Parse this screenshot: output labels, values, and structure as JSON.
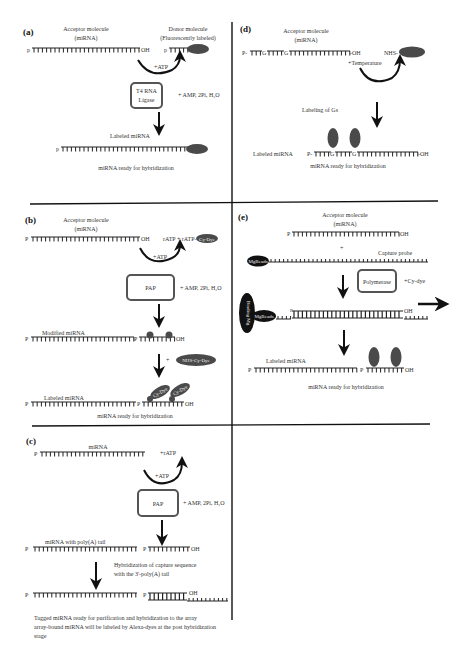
{
  "panels": {
    "a": {
      "label": "(a)",
      "acceptor": "Acceptor molecule",
      "acceptor_sub": "(miRNA)",
      "donor": "Donor molecule",
      "donor_sub": "(Fluorescently labeled)",
      "p": "p",
      "oh": "OH",
      "atp": "+ATP",
      "enzyme_line1": "T4 RNA",
      "enzyme_line2": "Ligase",
      "byproducts": "+ AMP, 2Pi, H₂O",
      "labeled": "Labeled miRNA",
      "ready": "miRNA ready for hybridization"
    },
    "b": {
      "label": "(b)",
      "acceptor": "Acceptor molecule",
      "acceptor_sub": "(miRNA)",
      "p": "P",
      "oh": "OH",
      "ratp": "rATP + rATP-",
      "dye": "Cy-Dye",
      "atp": "+ATP",
      "enzyme": "PAP",
      "byproducts": "+ AMP, 2Pi, H₂O",
      "modified": "Modified miRNA",
      "nhs": "NHS-Cy-Dye",
      "plus": "+",
      "labeled": "Labeled miRNA",
      "ready": "miRNA ready for hybridization"
    },
    "c": {
      "label": "(c)",
      "mirna": "miRNA",
      "p": "P",
      "oh": "OH",
      "ratp": "+rATP",
      "atp": "+ATP",
      "enzyme": "PAP",
      "byproducts": "+ AMP, 2Pi, H₂O",
      "polya": "miRNA with poly(A) tail",
      "hyb_line1": "Hybridization of capture sequence",
      "hyb_line2": "with the 3'-poly(A) tail",
      "note_line1": "Tagged miRNA ready for purification and hybridization to the array",
      "note_line2": "array-bound miRNA will be labeled by Alexa-dyes at the post hybridization",
      "note_line3": "stage"
    },
    "d": {
      "label": "(d)",
      "acceptor": "Acceptor molecule",
      "acceptor_sub": "(miRNA)",
      "p": "P-",
      "oh": "-OH",
      "g": "G",
      "nhs": "NHS-",
      "temp": "+Temperature",
      "labeling": "Labeling of Gs",
      "labeled": "Labeled miRNA",
      "ready": "miRNA ready for hybridization"
    },
    "e": {
      "label": "(e)",
      "acceptor": "Acceptor molecule",
      "acceptor_sub": "(miRNA)",
      "p": "P",
      "oh": "OH",
      "plus": "+",
      "capture": "Capture probe",
      "beads": "MgBeads",
      "binding": "Binding Mg",
      "enzyme": "Polymerase",
      "cydye": "+Cy-dye",
      "labeled": "Labeled miRNA",
      "ready": "miRNA ready for hybridization"
    }
  },
  "colors": {
    "ink": "#222222",
    "label_oval": "#4a4a4a",
    "enzyme_box": "#555555"
  }
}
